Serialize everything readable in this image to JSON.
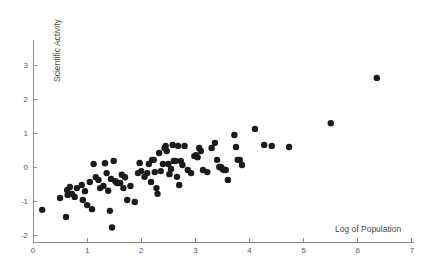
{
  "chart_data": {
    "type": "scatter",
    "title": "",
    "xlabel": "Log of Population",
    "ylabel": "Scientific Activity",
    "xlim": [
      0,
      7
    ],
    "ylim": [
      -2,
      3.35
    ],
    "xticks": [
      0,
      1,
      2,
      3,
      4,
      5,
      6,
      7
    ],
    "xticklabels": [
      "0",
      "1",
      "2",
      "3",
      "4",
      "5",
      "6",
      "7"
    ],
    "yticks": [
      -2,
      -1,
      0,
      1,
      2,
      3
    ],
    "yticklabels": [
      "-2",
      "-1",
      "0",
      "1",
      "2",
      "3"
    ],
    "grid": false,
    "legend": null,
    "marker": "filled-circle",
    "marker_color": "#1b1b1b",
    "marker_size_px": 3.2,
    "axis_color": "#8d8d8d",
    "background_color": "#ffffff",
    "n_points": 94,
    "points": [
      {
        "x": 0.17,
        "y": -1.26
      },
      {
        "x": 0.5,
        "y": -0.91
      },
      {
        "x": 0.61,
        "y": -1.47
      },
      {
        "x": 0.63,
        "y": -0.68
      },
      {
        "x": 0.64,
        "y": -0.82
      },
      {
        "x": 0.68,
        "y": -0.59
      },
      {
        "x": 0.72,
        "y": -0.79
      },
      {
        "x": 0.77,
        "y": -0.88
      },
      {
        "x": 0.81,
        "y": -0.62
      },
      {
        "x": 0.9,
        "y": -0.53
      },
      {
        "x": 0.92,
        "y": -0.97
      },
      {
        "x": 0.96,
        "y": -0.71
      },
      {
        "x": 1.0,
        "y": -1.12
      },
      {
        "x": 1.05,
        "y": -0.44
      },
      {
        "x": 1.09,
        "y": -1.24
      },
      {
        "x": 1.12,
        "y": 0.09
      },
      {
        "x": 1.16,
        "y": -0.3
      },
      {
        "x": 1.21,
        "y": -0.38
      },
      {
        "x": 1.24,
        "y": -0.62
      },
      {
        "x": 1.3,
        "y": -0.56
      },
      {
        "x": 1.33,
        "y": 0.11
      },
      {
        "x": 1.36,
        "y": -0.18
      },
      {
        "x": 1.39,
        "y": -0.7
      },
      {
        "x": 1.42,
        "y": -1.29
      },
      {
        "x": 1.44,
        "y": -0.35
      },
      {
        "x": 1.46,
        "y": -1.78
      },
      {
        "x": 1.49,
        "y": 0.18
      },
      {
        "x": 1.52,
        "y": -0.42
      },
      {
        "x": 1.55,
        "y": -0.47
      },
      {
        "x": 1.58,
        "y": -0.47
      },
      {
        "x": 1.61,
        "y": -0.47
      },
      {
        "x": 1.64,
        "y": -0.23
      },
      {
        "x": 1.67,
        "y": -0.62
      },
      {
        "x": 1.7,
        "y": -0.3
      },
      {
        "x": 1.74,
        "y": -0.97
      },
      {
        "x": 1.8,
        "y": -0.56
      },
      {
        "x": 1.88,
        "y": -1.03
      },
      {
        "x": 1.94,
        "y": -0.18
      },
      {
        "x": 1.97,
        "y": 0.12
      },
      {
        "x": 2.0,
        "y": -0.12
      },
      {
        "x": 2.06,
        "y": -0.29
      },
      {
        "x": 2.11,
        "y": -0.18
      },
      {
        "x": 2.14,
        "y": 0.09
      },
      {
        "x": 2.18,
        "y": -0.44
      },
      {
        "x": 2.2,
        "y": 0.21
      },
      {
        "x": 2.23,
        "y": 0.21
      },
      {
        "x": 2.25,
        "y": -0.15
      },
      {
        "x": 2.28,
        "y": -0.62
      },
      {
        "x": 2.3,
        "y": -0.79
      },
      {
        "x": 2.33,
        "y": 0.41
      },
      {
        "x": 2.36,
        "y": -0.12
      },
      {
        "x": 2.4,
        "y": 0.09
      },
      {
        "x": 2.43,
        "y": 0.56
      },
      {
        "x": 2.45,
        "y": 0.62
      },
      {
        "x": 2.47,
        "y": 0.47
      },
      {
        "x": 2.5,
        "y": 0.09
      },
      {
        "x": 2.52,
        "y": -0.21
      },
      {
        "x": 2.55,
        "y": -0.06
      },
      {
        "x": 2.58,
        "y": 0.65
      },
      {
        "x": 2.6,
        "y": 0.18
      },
      {
        "x": 2.63,
        "y": 0.18
      },
      {
        "x": 2.66,
        "y": -0.29
      },
      {
        "x": 2.68,
        "y": 0.62
      },
      {
        "x": 2.7,
        "y": -0.53
      },
      {
        "x": 2.73,
        "y": 0.18
      },
      {
        "x": 2.76,
        "y": 0.06
      },
      {
        "x": 2.8,
        "y": 0.62
      },
      {
        "x": 2.86,
        "y": -0.09
      },
      {
        "x": 2.92,
        "y": -0.18
      },
      {
        "x": 2.98,
        "y": 0.32
      },
      {
        "x": 3.01,
        "y": 0.35
      },
      {
        "x": 3.04,
        "y": 0.29
      },
      {
        "x": 3.07,
        "y": 0.56
      },
      {
        "x": 3.1,
        "y": 0.47
      },
      {
        "x": 3.14,
        "y": -0.09
      },
      {
        "x": 3.22,
        "y": -0.15
      },
      {
        "x": 3.3,
        "y": 0.56
      },
      {
        "x": 3.36,
        "y": 0.71
      },
      {
        "x": 3.4,
        "y": 0.21
      },
      {
        "x": 3.44,
        "y": 0.0
      },
      {
        "x": 3.47,
        "y": 0.0
      },
      {
        "x": 3.5,
        "y": -0.06
      },
      {
        "x": 3.53,
        "y": -0.09
      },
      {
        "x": 3.56,
        "y": -0.09
      },
      {
        "x": 3.6,
        "y": -0.38
      },
      {
        "x": 3.72,
        "y": 0.94
      },
      {
        "x": 3.75,
        "y": 0.59
      },
      {
        "x": 3.78,
        "y": 0.21
      },
      {
        "x": 3.82,
        "y": 0.21
      },
      {
        "x": 3.86,
        "y": 0.06
      },
      {
        "x": 4.1,
        "y": 1.12
      },
      {
        "x": 4.27,
        "y": 0.65
      },
      {
        "x": 4.41,
        "y": 0.62
      },
      {
        "x": 4.73,
        "y": 0.59
      },
      {
        "x": 5.5,
        "y": 1.29
      },
      {
        "x": 6.35,
        "y": 2.62
      }
    ]
  },
  "axes": {
    "y_title": "Scientific Activity",
    "x_title": "Log of Population"
  }
}
